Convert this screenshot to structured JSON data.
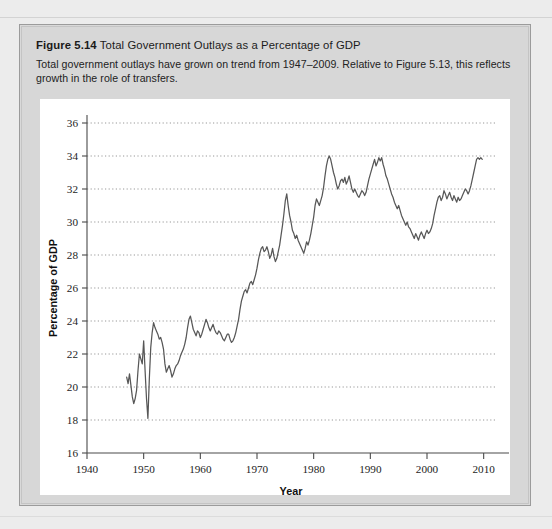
{
  "figure": {
    "number_label": "Figure 5.14",
    "title": "Total Government Outlays as a Percentage of GDP",
    "description": "Total government outlays have grown on trend from 1947–2009. Relative to Figure 5.13, this reflects growth in the role of transfers."
  },
  "colors": {
    "page_background": "#ececec",
    "panel_background": "#d7d7d7",
    "panel_border": "#9b9b9b",
    "plot_background": "#ffffff",
    "line": "#575757",
    "gridline": "#8d8d8d",
    "axis": "#4a4a4a"
  },
  "chart_data": {
    "type": "line",
    "title": "Total Government Outlays as a Percentage of GDP",
    "xlabel": "Year",
    "ylabel": "Percentage of GDP",
    "xlim": [
      1940,
      2012
    ],
    "ylim": [
      16,
      36
    ],
    "xticks": [
      1940,
      1950,
      1960,
      1970,
      1980,
      1990,
      2000,
      2010
    ],
    "yticks": [
      16,
      18,
      20,
      22,
      24,
      26,
      28,
      30,
      32,
      34,
      36
    ],
    "grid": "horizontal-dotted",
    "legend": "none",
    "series": [
      {
        "name": "Total government outlays (% of GDP)",
        "x": [
          1947.0,
          1947.25,
          1947.5,
          1947.75,
          1948.0,
          1948.25,
          1948.5,
          1948.75,
          1949.0,
          1949.25,
          1949.5,
          1949.75,
          1950.0,
          1950.25,
          1950.5,
          1950.75,
          1951.0,
          1951.25,
          1951.5,
          1951.75,
          1952.0,
          1952.25,
          1952.5,
          1952.75,
          1953.0,
          1953.25,
          1953.5,
          1953.75,
          1954.0,
          1954.25,
          1954.5,
          1954.75,
          1955.0,
          1955.25,
          1955.5,
          1955.75,
          1956.0,
          1956.25,
          1956.5,
          1956.75,
          1957.0,
          1957.25,
          1957.5,
          1957.75,
          1958.0,
          1958.25,
          1958.5,
          1958.75,
          1959.0,
          1959.25,
          1959.5,
          1959.75,
          1960.0,
          1960.25,
          1960.5,
          1960.75,
          1961.0,
          1961.25,
          1961.5,
          1961.75,
          1962.0,
          1962.25,
          1962.5,
          1962.75,
          1963.0,
          1963.25,
          1963.5,
          1963.75,
          1964.0,
          1964.25,
          1964.5,
          1964.75,
          1965.0,
          1965.25,
          1965.5,
          1965.75,
          1966.0,
          1966.25,
          1966.5,
          1966.75,
          1967.0,
          1967.25,
          1967.5,
          1967.75,
          1968.0,
          1968.25,
          1968.5,
          1968.75,
          1969.0,
          1969.25,
          1969.5,
          1969.75,
          1970.0,
          1970.25,
          1970.5,
          1970.75,
          1971.0,
          1971.25,
          1971.5,
          1971.75,
          1972.0,
          1972.25,
          1972.5,
          1972.75,
          1973.0,
          1973.25,
          1973.5,
          1973.75,
          1974.0,
          1974.25,
          1974.5,
          1974.75,
          1975.0,
          1975.25,
          1975.5,
          1975.75,
          1976.0,
          1976.25,
          1976.5,
          1976.75,
          1977.0,
          1977.25,
          1977.5,
          1977.75,
          1978.0,
          1978.25,
          1978.5,
          1978.75,
          1979.0,
          1979.25,
          1979.5,
          1979.75,
          1980.0,
          1980.25,
          1980.5,
          1980.75,
          1981.0,
          1981.25,
          1981.5,
          1981.75,
          1982.0,
          1982.25,
          1982.5,
          1982.75,
          1983.0,
          1983.25,
          1983.5,
          1983.75,
          1984.0,
          1984.25,
          1984.5,
          1984.75,
          1985.0,
          1985.25,
          1985.5,
          1985.75,
          1986.0,
          1986.25,
          1986.5,
          1986.75,
          1987.0,
          1987.25,
          1987.5,
          1987.75,
          1988.0,
          1988.25,
          1988.5,
          1988.75,
          1989.0,
          1989.25,
          1989.5,
          1989.75,
          1990.0,
          1990.25,
          1990.5,
          1990.75,
          1991.0,
          1991.25,
          1991.5,
          1991.75,
          1992.0,
          1992.25,
          1992.5,
          1992.75,
          1993.0,
          1993.25,
          1993.5,
          1993.75,
          1994.0,
          1994.25,
          1994.5,
          1994.75,
          1995.0,
          1995.25,
          1995.5,
          1995.75,
          1996.0,
          1996.25,
          1996.5,
          1996.75,
          1997.0,
          1997.25,
          1997.5,
          1997.75,
          1998.0,
          1998.25,
          1998.5,
          1998.75,
          1999.0,
          1999.25,
          1999.5,
          1999.75,
          2000.0,
          2000.25,
          2000.5,
          2000.75,
          2001.0,
          2001.25,
          2001.5,
          2001.75,
          2002.0,
          2002.25,
          2002.5,
          2002.75,
          2003.0,
          2003.25,
          2003.5,
          2003.75,
          2004.0,
          2004.25,
          2004.5,
          2004.75,
          2005.0,
          2005.25,
          2005.5,
          2005.75,
          2006.0,
          2006.25,
          2006.5,
          2006.75,
          2007.0,
          2007.25,
          2007.5,
          2007.75,
          2008.0,
          2008.25,
          2008.5,
          2008.75,
          2009.0,
          2009.25,
          2009.5,
          2009.75
        ],
        "y": [
          20.6,
          20.2,
          20.8,
          20.1,
          19.4,
          19.0,
          19.3,
          19.8,
          21.0,
          22.0,
          21.7,
          21.4,
          22.8,
          21.0,
          19.3,
          18.1,
          20.5,
          22.4,
          23.3,
          23.9,
          23.6,
          23.4,
          23.2,
          22.9,
          23.0,
          22.7,
          22.3,
          21.4,
          20.9,
          21.1,
          21.3,
          21.0,
          20.6,
          20.8,
          21.1,
          21.3,
          21.4,
          21.6,
          21.9,
          22.1,
          22.3,
          22.6,
          23.0,
          23.6,
          24.1,
          24.3,
          23.9,
          23.5,
          23.3,
          23.1,
          23.4,
          23.3,
          23.0,
          23.2,
          23.5,
          23.8,
          24.1,
          23.9,
          23.6,
          23.4,
          23.6,
          23.8,
          23.5,
          23.3,
          23.2,
          23.4,
          23.3,
          23.1,
          22.9,
          22.8,
          23.0,
          23.2,
          23.2,
          22.9,
          22.7,
          22.8,
          23.0,
          23.3,
          23.7,
          24.1,
          24.7,
          25.2,
          25.5,
          25.8,
          25.9,
          25.7,
          26.0,
          26.3,
          26.4,
          26.2,
          26.5,
          26.8,
          27.2,
          27.7,
          28.1,
          28.4,
          28.5,
          28.2,
          28.3,
          28.5,
          28.2,
          27.8,
          28.0,
          28.4,
          27.9,
          27.6,
          27.8,
          28.2,
          28.6,
          29.2,
          29.8,
          30.5,
          31.3,
          31.7,
          31.0,
          30.4,
          30.0,
          29.5,
          29.3,
          29.0,
          29.2,
          28.9,
          28.7,
          28.5,
          28.3,
          28.1,
          28.4,
          28.8,
          28.6,
          28.9,
          29.3,
          29.8,
          30.3,
          31.0,
          31.4,
          31.2,
          31.0,
          31.3,
          31.6,
          32.1,
          32.8,
          33.4,
          33.8,
          34.0,
          33.8,
          33.4,
          33.0,
          32.7,
          32.3,
          32.0,
          32.2,
          32.5,
          32.6,
          32.4,
          32.7,
          32.3,
          32.5,
          32.8,
          32.4,
          32.0,
          31.8,
          32.0,
          31.8,
          31.6,
          31.5,
          31.7,
          31.9,
          31.8,
          31.6,
          31.8,
          32.2,
          32.6,
          32.9,
          33.2,
          33.5,
          33.8,
          33.4,
          33.6,
          33.9,
          33.7,
          33.9,
          33.5,
          33.2,
          32.8,
          32.6,
          32.3,
          32.0,
          31.7,
          31.5,
          31.2,
          31.0,
          30.8,
          31.0,
          30.7,
          30.4,
          30.2,
          30.0,
          29.8,
          30.0,
          29.7,
          29.6,
          29.4,
          29.2,
          29.0,
          29.3,
          29.1,
          28.9,
          29.2,
          29.4,
          29.2,
          29.0,
          29.3,
          29.5,
          29.3,
          29.4,
          29.6,
          29.9,
          30.4,
          30.8,
          31.2,
          31.5,
          31.6,
          31.3,
          31.5,
          31.9,
          31.7,
          31.4,
          31.6,
          31.8,
          31.5,
          31.3,
          31.6,
          31.4,
          31.2,
          31.5,
          31.3,
          31.4,
          31.6,
          31.8,
          32.0,
          31.9,
          31.7,
          31.9,
          32.2,
          32.6,
          33.0,
          33.4,
          33.8,
          33.9,
          33.8,
          33.9,
          33.8
        ]
      }
    ]
  }
}
